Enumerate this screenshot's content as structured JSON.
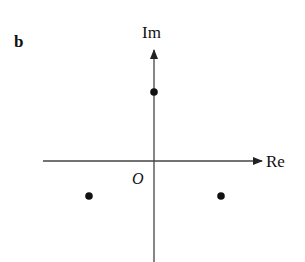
{
  "figure": {
    "panel_label": "b",
    "axes": {
      "imag_label": "Im",
      "real_label": "Re",
      "origin_label": "O"
    },
    "points": [
      {
        "name": "top",
        "x": 154,
        "y": 92
      },
      {
        "name": "lower-left",
        "x": 89,
        "y": 196
      },
      {
        "name": "lower-right",
        "x": 221,
        "y": 196
      }
    ],
    "colors": {
      "ink": "#111111",
      "axis": "#444444"
    }
  }
}
